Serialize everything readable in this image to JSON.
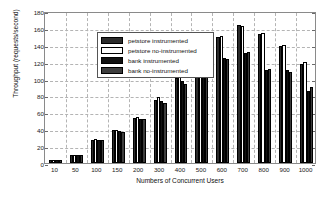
{
  "chart_data": {
    "type": "bar",
    "title": "",
    "xlabel": "Numbers of Concurrent Users",
    "ylabel": "Throughput (requests/second)",
    "categories": [
      "10",
      "50",
      "100",
      "150",
      "200",
      "300",
      "400",
      "500",
      "600",
      "700",
      "800",
      "900",
      "1000"
    ],
    "ylim": [
      0,
      180
    ],
    "yticks": [
      0,
      20,
      40,
      60,
      80,
      100,
      120,
      140,
      160,
      180
    ],
    "grid": true,
    "legend_position": "upper-left",
    "series": [
      {
        "name": "petstore instrumented",
        "color": "#2b2b2b",
        "values": [
          3,
          9,
          27,
          39,
          53,
          75,
          101,
          125,
          149,
          163,
          153,
          139,
          117
        ]
      },
      {
        "name": "petstore no-instrumented",
        "color": "#fdfdfd",
        "values": [
          3,
          10,
          28,
          39,
          54,
          78,
          102,
          127,
          150,
          162,
          154,
          140,
          120
        ]
      },
      {
        "name": "bank instrumented",
        "color": "#111111",
        "values": [
          3,
          9,
          27,
          38,
          52,
          73,
          97,
          115,
          124,
          130,
          110,
          110,
          85
        ]
      },
      {
        "name": "bank no-instrumented",
        "color": "#3d3d3d",
        "values": [
          3,
          10,
          27,
          37,
          52,
          71,
          94,
          116,
          123,
          131,
          111,
          108,
          90
        ]
      }
    ]
  },
  "legend": {
    "items": [
      {
        "label": "petstore instrumented"
      },
      {
        "label": "petstore no-instrumented"
      },
      {
        "label": "bank instrumented"
      },
      {
        "label": "bank no-instrumented"
      }
    ]
  }
}
